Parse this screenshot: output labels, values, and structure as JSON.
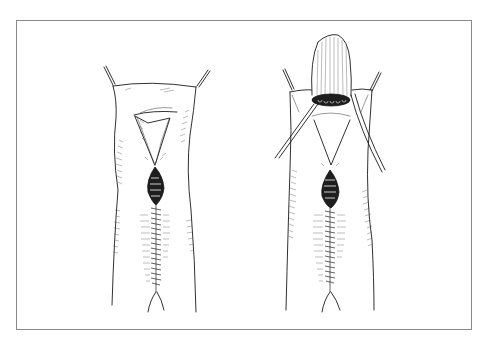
{
  "figure": {
    "type": "surgical line illustration",
    "style": "black ink on white, framed",
    "colors": {
      "background": "#ffffff",
      "frame": "#8a8a8a",
      "ink": "#1a1a1a"
    },
    "panels": [
      {
        "id": "left",
        "depiction": "sutured midline incision with open dark wound segment below a triangular retracted opening, tissue edges held by two traction sutures at top"
      },
      {
        "id": "right",
        "depiction": "same closure with a cylindrical tissue segment (stump) lifted upward out of the opening, two retracting strands at sides"
      }
    ]
  }
}
